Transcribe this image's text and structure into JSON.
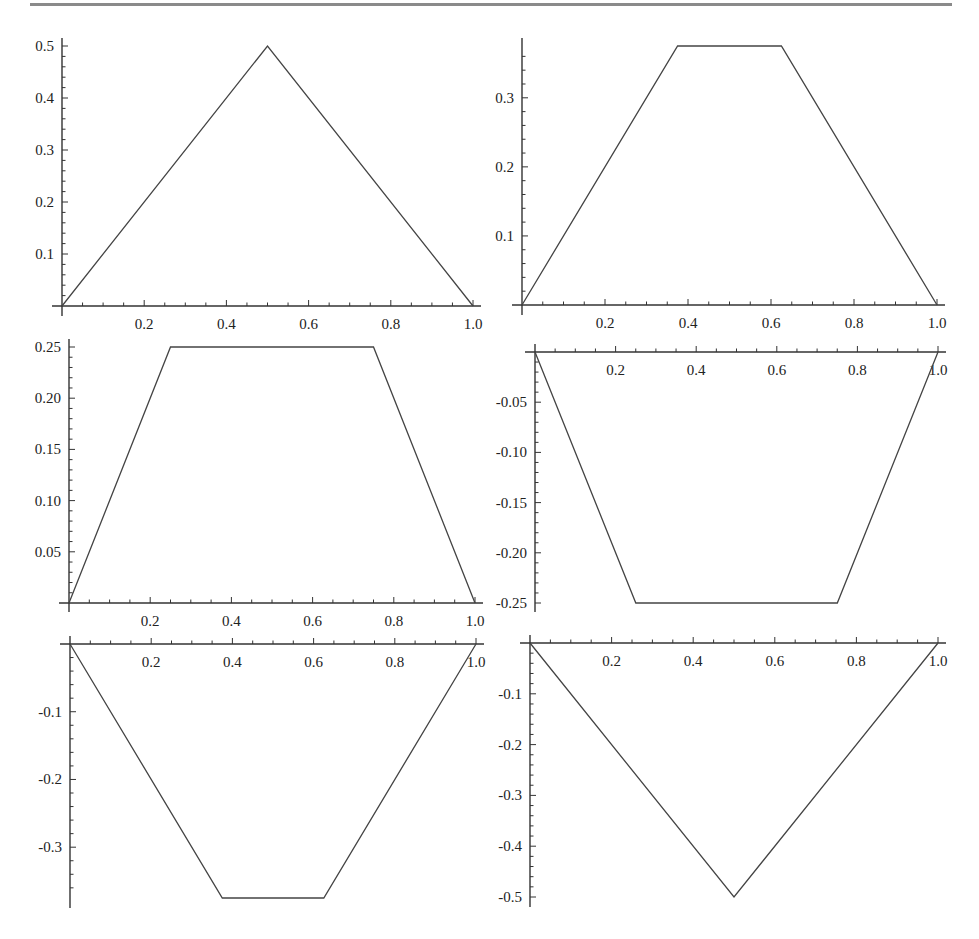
{
  "chart_data": [
    {
      "type": "line",
      "title": "",
      "xlabel": "",
      "ylabel": "",
      "x": [
        0,
        0.5,
        1.0
      ],
      "values": [
        0,
        0.5,
        0
      ],
      "xlim": [
        0,
        1.0
      ],
      "ylim": [
        0,
        0.5
      ],
      "xticks": [
        "0.2",
        "0.4",
        "0.6",
        "0.8",
        "1.0"
      ],
      "yticks": [
        "0.1",
        "0.2",
        "0.3",
        "0.4",
        "0.5"
      ],
      "grid": false,
      "position": "top-left"
    },
    {
      "type": "line",
      "title": "",
      "xlabel": "",
      "ylabel": "",
      "x": [
        0,
        0.375,
        0.625,
        1.0
      ],
      "values": [
        0,
        0.375,
        0.375,
        0
      ],
      "xlim": [
        0,
        1.0
      ],
      "ylim": [
        0,
        0.375
      ],
      "xticks": [
        "0.2",
        "0.4",
        "0.6",
        "0.8",
        "1.0"
      ],
      "yticks": [
        "0.1",
        "0.2",
        "0.3"
      ],
      "grid": false,
      "position": "top-right"
    },
    {
      "type": "line",
      "title": "",
      "xlabel": "",
      "ylabel": "",
      "x": [
        0,
        0.25,
        0.75,
        1.0
      ],
      "values": [
        0,
        0.25,
        0.25,
        0
      ],
      "xlim": [
        0,
        1.0
      ],
      "ylim": [
        0,
        0.25
      ],
      "xticks": [
        "0.2",
        "0.4",
        "0.6",
        "0.8",
        "1.0"
      ],
      "yticks": [
        "0.05",
        "0.10",
        "0.15",
        "0.20",
        "0.25"
      ],
      "grid": false,
      "position": "middle-left"
    },
    {
      "type": "line",
      "title": "",
      "xlabel": "",
      "ylabel": "",
      "x": [
        0,
        0.25,
        0.75,
        1.0
      ],
      "values": [
        0,
        -0.25,
        -0.25,
        0
      ],
      "xlim": [
        0,
        1.0
      ],
      "ylim": [
        -0.25,
        0
      ],
      "xticks": [
        "0.2",
        "0.4",
        "0.6",
        "0.8",
        "1.0"
      ],
      "yticks": [
        "-0.05",
        "-0.10",
        "-0.15",
        "-0.20",
        "-0.25"
      ],
      "grid": false,
      "position": "middle-right"
    },
    {
      "type": "line",
      "title": "",
      "xlabel": "",
      "ylabel": "",
      "x": [
        0,
        0.375,
        0.625,
        1.0
      ],
      "values": [
        0,
        -0.375,
        -0.375,
        0
      ],
      "xlim": [
        0,
        1.0
      ],
      "ylim": [
        -0.375,
        0
      ],
      "xticks": [
        "0.2",
        "0.4",
        "0.6",
        "0.8",
        "1.0"
      ],
      "yticks": [
        "-0.1",
        "-0.2",
        "-0.3"
      ],
      "grid": false,
      "position": "bottom-left"
    },
    {
      "type": "line",
      "title": "",
      "xlabel": "",
      "ylabel": "",
      "x": [
        0,
        0.5,
        1.0
      ],
      "values": [
        0,
        -0.5,
        0
      ],
      "xlim": [
        0,
        1.0
      ],
      "ylim": [
        -0.5,
        0
      ],
      "xticks": [
        "0.2",
        "0.4",
        "0.6",
        "0.8",
        "1.0"
      ],
      "yticks": [
        "-0.1",
        "-0.2",
        "-0.3",
        "-0.4",
        "-0.5"
      ],
      "grid": false,
      "position": "bottom-right"
    }
  ],
  "layout": [
    {
      "x0": 62,
      "x1": 473,
      "yzero": 306,
      "ytop_val": 0.5,
      "ytop_px": 46,
      "axis_y_from": 38,
      "axis_y_to": 316,
      "xlabel_below": true
    },
    {
      "x0": 522,
      "x1": 937,
      "yzero": 305,
      "ytop_val": 0.375,
      "ytop_px": 46,
      "axis_y_from": 38,
      "axis_y_to": 315,
      "xlabel_below": true
    },
    {
      "x0": 69,
      "x1": 475,
      "yzero": 603,
      "ytop_val": 0.25,
      "ytop_px": 347,
      "axis_y_from": 339,
      "axis_y_to": 612,
      "xlabel_below": true
    },
    {
      "x0": 535,
      "x1": 938,
      "yzero": 352,
      "ytop_val": -0.25,
      "ytop_px": 603,
      "axis_y_from": 344,
      "axis_y_to": 612,
      "xlabel_below": true
    },
    {
      "x0": 70,
      "x1": 476,
      "yzero": 644,
      "ytop_val": -0.375,
      "ytop_px": 898,
      "axis_y_from": 636,
      "axis_y_to": 908,
      "xlabel_below": true
    },
    {
      "x0": 530,
      "x1": 938,
      "yzero": 643,
      "ytop_val": -0.5,
      "ytop_px": 897,
      "axis_y_from": 635,
      "axis_y_to": 907,
      "xlabel_below": true
    }
  ]
}
